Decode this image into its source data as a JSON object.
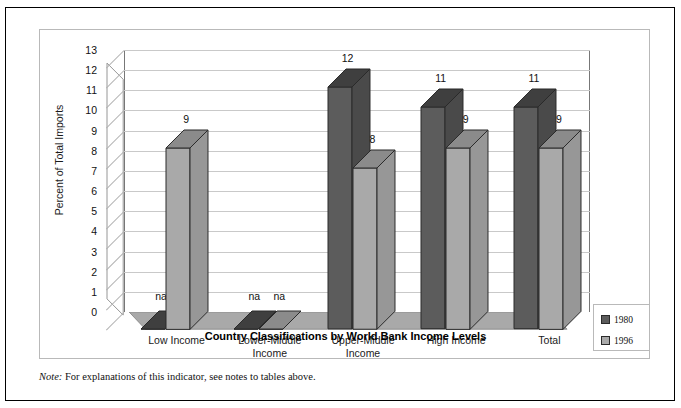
{
  "figure": {
    "x_axis_title": "Country Classifications by World Bank Income Levels",
    "y_axis_title": "Percent of Total Imports"
  },
  "legend": {
    "items": [
      {
        "label": "1980",
        "color": "#5c5c5c"
      },
      {
        "label": "1996",
        "color": "#a9a9a9"
      }
    ]
  },
  "footnote": {
    "note_word": "Note:",
    "text": " For explanations of this indicator, see notes to tables above."
  },
  "colors": {
    "series_1980_face": "#5c5c5c",
    "series_1980_top": "#3f3f3f",
    "series_1980_side": "#4a4a4a",
    "series_1996_face": "#a9a9a9",
    "series_1996_top": "#8b8b8b",
    "series_1996_side": "#979797",
    "floor": "#a9a9a9",
    "wall": "#ffffff",
    "gridline": "#c9c9c9",
    "frame": "#b9b9b9"
  },
  "chart_data": {
    "type": "bar",
    "title": "",
    "subtitle": "",
    "xlabel": "Country Classifications by World Bank Income Levels",
    "ylabel": "Percent of Total Imports",
    "ylim": [
      0,
      13
    ],
    "yticks": [
      0,
      1,
      2,
      3,
      4,
      5,
      6,
      7,
      8,
      9,
      10,
      11,
      12,
      13
    ],
    "grid": true,
    "legend_position": "bottom-right",
    "three_d": true,
    "categories": [
      "Low Income",
      "Lower-Middle Income",
      "Upper-Middle Income",
      "High Income",
      "Total"
    ],
    "category_label_lines": [
      [
        "Low Income"
      ],
      [
        "Lower-Middle",
        "Income"
      ],
      [
        "Upper-Middle",
        "Income"
      ],
      [
        "High Income"
      ],
      [
        "Total"
      ]
    ],
    "series": [
      {
        "name": "1980",
        "values": [
          null,
          null,
          12,
          11,
          11
        ],
        "data_labels": [
          "na",
          "na",
          "12",
          "11",
          "11"
        ]
      },
      {
        "name": "1996",
        "values": [
          9,
          null,
          8,
          9,
          9
        ],
        "data_labels": [
          "9",
          "na",
          "8",
          "9",
          "9"
        ]
      }
    ]
  }
}
